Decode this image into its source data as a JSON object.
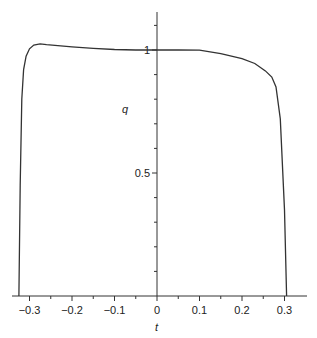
{
  "chart_data": {
    "type": "line",
    "title": "",
    "xlabel": "t",
    "ylabel": "q",
    "xlim": [
      -0.34,
      0.35
    ],
    "ylim": [
      0,
      1.15
    ],
    "grid": false,
    "legend": null,
    "x_ticks": [
      "-0.3",
      "-0.2",
      "-0.1",
      "0",
      "0.1",
      "0.2",
      "0.3"
    ],
    "y_ticks": [
      "0.5",
      "1"
    ],
    "series": [
      {
        "name": "q(t)",
        "color": "#333333",
        "x": [
          -0.325,
          -0.322,
          -0.318,
          -0.314,
          -0.308,
          -0.3,
          -0.29,
          -0.275,
          -0.26,
          -0.2,
          -0.15,
          -0.1,
          -0.05,
          0.0,
          0.05,
          0.1,
          0.15,
          0.2,
          0.23,
          0.255,
          0.27,
          0.28,
          0.29,
          0.3,
          0.305
        ],
        "y": [
          0.0,
          0.45,
          0.8,
          0.92,
          0.975,
          1.005,
          1.02,
          1.025,
          1.022,
          1.013,
          1.007,
          1.002,
          1.0,
          1.0,
          1.0,
          0.999,
          0.985,
          0.965,
          0.945,
          0.915,
          0.89,
          0.85,
          0.72,
          0.35,
          0.0
        ]
      }
    ]
  }
}
